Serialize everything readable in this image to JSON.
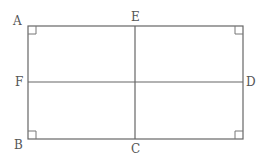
{
  "diagram": {
    "type": "rectangle-with-midlines",
    "rectangle": {
      "x": 28,
      "y": 26,
      "width": 215,
      "height": 113
    },
    "labels": {
      "A": {
        "text": "A",
        "x": 13,
        "y": 25
      },
      "B": {
        "text": "B",
        "x": 14,
        "y": 149
      },
      "C": {
        "text": "C",
        "x": 131,
        "y": 153
      },
      "D": {
        "text": "D",
        "x": 246,
        "y": 86
      },
      "E": {
        "text": "E",
        "x": 131,
        "y": 21
      },
      "F": {
        "text": "F",
        "x": 15,
        "y": 86
      }
    },
    "segments": [
      {
        "name": "EC",
        "from": "E",
        "to": "C"
      },
      {
        "name": "FD",
        "from": "F",
        "to": "D"
      }
    ],
    "right_angles": [
      "A",
      "B",
      "C-corner",
      "D-corner"
    ],
    "colors": {
      "line": "#666666",
      "label": "#555555"
    }
  }
}
